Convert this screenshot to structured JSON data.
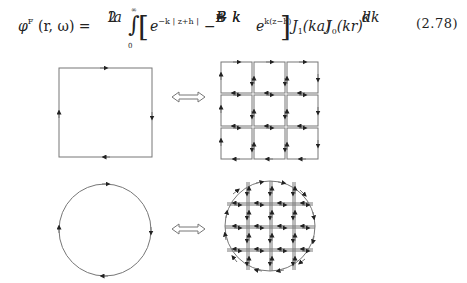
{
  "equation": {
    "lhs": "φ",
    "lhs_sup": "F",
    "lhs_args": "(r, ω) =",
    "coef_num": "Ia",
    "coef_den": "2",
    "integral": "∫",
    "int_upper": "∞",
    "int_lower": "0",
    "bracket_open": "[",
    "term1_base": "e",
    "term1_exp": "−k | z+h |",
    "minus": "−",
    "frac_num": "B",
    "frac_num_sub": "E",
    "frac_num_rest": " − k",
    "frac_den": "B",
    "frac_den_sub": "E",
    "frac_den_rest": " + k",
    "term2_base": "e",
    "term2_exp": "k(z−h)",
    "bracket_close": "]",
    "bessel1": "J",
    "bessel1_sub": "1",
    "bessel1_arg": "(ka)",
    "bessel2": "J",
    "bessel2_sub": "0",
    "bessel2_arg": "(kr)",
    "dk_num": "dk",
    "dk_den": "k",
    "number": "(2.78)"
  },
  "figure": {
    "rows": [
      {
        "left_shape": "square-loop",
        "relation": "double-arrow",
        "right_shape": "square-grid-3x3"
      },
      {
        "left_shape": "circle-loop",
        "relation": "double-arrow",
        "right_shape": "circular-grid"
      }
    ],
    "line_color": "#777777",
    "arrow_color": "#222222"
  }
}
